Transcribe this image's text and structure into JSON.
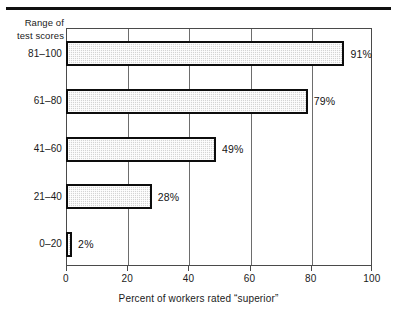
{
  "chart_data": {
    "type": "bar",
    "orientation": "horizontal",
    "title": "",
    "xlabel": "Percent of workers rated “superior”",
    "ylabel": "Range of test scores",
    "ylabel_lines": [
      "Range of",
      "test scores"
    ],
    "categories": [
      "81–100",
      "61–80",
      "41–60",
      "21–40",
      "0–20"
    ],
    "values": [
      91,
      79,
      49,
      28,
      2
    ],
    "value_labels": [
      "91%",
      "79%",
      "49%",
      "28%",
      "2%"
    ],
    "xlim": [
      0,
      100
    ],
    "xticks": [
      0,
      20,
      40,
      60,
      80,
      100
    ],
    "xtick_labels": [
      "0",
      "20",
      "40",
      "60",
      "80",
      "100"
    ],
    "grid": "vertical",
    "legend": "none",
    "bar_fill_color": "#d4d4d4",
    "bar_edge_color": "#0d0d0d",
    "frame_color": "#4a4a4a"
  }
}
